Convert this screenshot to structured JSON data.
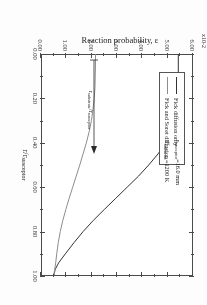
{
  "figure": {
    "exponent_label": "x10-2",
    "x_title_main": "r/r",
    "x_title_sub": "susceptor",
    "y_title_main": "Reaction probability, ",
    "y_title_symbol": "ε",
    "x_ticks": [
      "0.00",
      "0.20",
      "0.40",
      "0.60",
      "0.80",
      "1.00"
    ],
    "y_ticks": [
      "0.00",
      "1.00",
      "2.00",
      "3.00",
      "4.00",
      "5.00",
      "6.00"
    ]
  },
  "legend": {
    "items": [
      {
        "label": "Fick diffusion only",
        "color": "#333333"
      },
      {
        "label": "Fick and Soret diffusion",
        "color": "#8d8d8d"
      }
    ]
  },
  "conditions": {
    "line1_sym": "r",
    "line1_sub": "susceptor",
    "line1_val": "=16.0 mm",
    "line2_sym": "T",
    "line2_sub": "substrate",
    "line2_val": "=1200 K"
  },
  "annotation": {
    "num_sym": "r",
    "num_sub": "substrate",
    "den_sym": "/r",
    "den_sub": "susceptor",
    "arrow_at_x": "0.40"
  },
  "chart_data": {
    "type": "line",
    "title": "",
    "xlabel": "r/r_susceptor",
    "ylabel": "Reaction probability, ε (x10^-2)",
    "xlim": [
      0.0,
      1.0
    ],
    "ylim": [
      0.0,
      6.0
    ],
    "grid": false,
    "legend_position": "top-left",
    "x_tick_values": [
      0.0,
      0.2,
      0.4,
      0.6,
      0.8,
      1.0
    ],
    "y_tick_values": [
      0.0,
      1.0,
      2.0,
      3.0,
      4.0,
      5.0,
      6.0
    ],
    "annotations": [
      {
        "text": "r_susceptor=16.0 mm",
        "x": 0.52,
        "y": 5.6
      },
      {
        "text": "T_substrate=1200 K",
        "x": 0.52,
        "y": 5.2
      },
      {
        "text": "r_substrate/r_susceptor",
        "x": 0.2,
        "y": 1.05,
        "arrow_to_x": 0.4,
        "arrow_to_y": 1.05
      }
    ],
    "series": [
      {
        "name": "Fick diffusion only",
        "color": "#333333",
        "x": [
          0.0,
          0.05,
          0.1,
          0.15,
          0.2,
          0.25,
          0.3,
          0.35,
          0.4,
          0.45,
          0.5,
          0.55,
          0.6,
          0.65,
          0.7,
          0.75,
          0.8,
          0.85,
          0.9,
          0.94,
          0.97,
          1.0
        ],
        "y": [
          5.42,
          5.42,
          5.42,
          5.41,
          5.4,
          5.36,
          5.28,
          5.13,
          4.92,
          4.62,
          4.25,
          3.85,
          3.4,
          2.95,
          2.5,
          2.06,
          1.66,
          1.3,
          0.96,
          0.7,
          0.56,
          0.5
        ]
      },
      {
        "name": "Fick and Soret diffusion",
        "color": "#8d8d8d",
        "x": [
          0.0,
          0.05,
          0.1,
          0.15,
          0.2,
          0.25,
          0.3,
          0.35,
          0.4,
          0.45,
          0.5,
          0.55,
          0.6,
          0.65,
          0.7,
          0.75,
          0.8,
          0.85,
          0.9,
          0.94,
          0.97,
          1.0
        ],
        "y": [
          2.15,
          2.15,
          2.14,
          2.13,
          2.1,
          2.05,
          1.99,
          1.9,
          1.79,
          1.66,
          1.53,
          1.39,
          1.25,
          1.11,
          0.98,
          0.86,
          0.76,
          0.68,
          0.62,
          0.58,
          0.54,
          0.5
        ]
      }
    ]
  }
}
